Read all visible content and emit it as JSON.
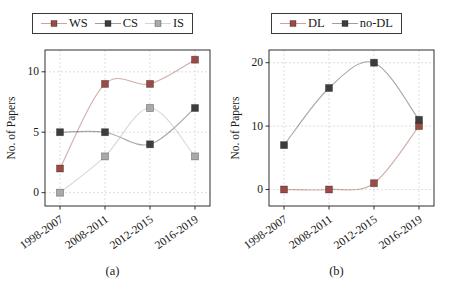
{
  "figure_background": "#ffffff",
  "style": {
    "grid_color": "#d9d9d9",
    "frame_color": "#1a1a1a",
    "text_color": "#1a1a1a",
    "marker_edge": "rgba(0,0,0,0.35)"
  },
  "chart_data": [
    {
      "type": "line",
      "caption": "(a)",
      "ylabel": "No. of Papers",
      "categories": [
        "1998-2007",
        "2008-2011",
        "2012-2015",
        "2016-2019"
      ],
      "yticks": [
        0,
        5,
        10
      ],
      "ylim": [
        -1.1,
        11.8
      ],
      "grid": true,
      "legend_position": "top",
      "series": [
        {
          "name": "WS",
          "color": "#9c4a45",
          "values": [
            2,
            9,
            9,
            11
          ]
        },
        {
          "name": "CS",
          "color": "#3d3d3d",
          "values": [
            5,
            5,
            4,
            7
          ]
        },
        {
          "name": "IS",
          "color": "#a9a9a9",
          "values": [
            0,
            3,
            7,
            3
          ]
        }
      ]
    },
    {
      "type": "line",
      "caption": "(b)",
      "ylabel": "No. of Papers",
      "categories": [
        "1998-2007",
        "2008-2011",
        "2012-2015",
        "2016-2019"
      ],
      "yticks": [
        0,
        10,
        20
      ],
      "ylim": [
        -2.6,
        22.0
      ],
      "grid": true,
      "legend_position": "top",
      "series": [
        {
          "name": "DL",
          "color": "#9c4a45",
          "values": [
            0,
            0,
            1,
            10
          ]
        },
        {
          "name": "no-DL",
          "color": "#3d3d3d",
          "values": [
            7,
            16,
            20,
            11
          ]
        }
      ]
    }
  ]
}
